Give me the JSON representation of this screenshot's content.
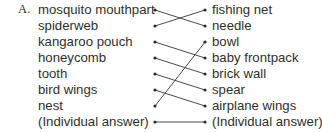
{
  "exercise": {
    "label": "A."
  },
  "matching": {
    "left_items": [
      {
        "id": "l1",
        "label": "mosquito mouthpart",
        "row": 1
      },
      {
        "id": "l2",
        "label": "spiderweb",
        "row": 2
      },
      {
        "id": "l3",
        "label": "kangaroo pouch",
        "row": 3
      },
      {
        "id": "l4",
        "label": "honeycomb",
        "row": 4
      },
      {
        "id": "l5",
        "label": "tooth",
        "row": 5
      },
      {
        "id": "l6",
        "label": "bird wings",
        "row": 6
      },
      {
        "id": "l7",
        "label": "nest",
        "row": 7
      },
      {
        "id": "l8",
        "label": "(Individual answer)",
        "row": 8
      }
    ],
    "right_items": [
      {
        "id": "r1",
        "label": "fishing net",
        "row": 1
      },
      {
        "id": "r2",
        "label": "needle",
        "row": 2
      },
      {
        "id": "r3",
        "label": "bowl",
        "row": 3
      },
      {
        "id": "r4",
        "label": "baby frontpack",
        "row": 4
      },
      {
        "id": "r5",
        "label": "brick wall",
        "row": 5
      },
      {
        "id": "r6",
        "label": "spear",
        "row": 6
      },
      {
        "id": "r7",
        "label": "airplane wings",
        "row": 7
      },
      {
        "id": "r8",
        "label": "(Individual answer)",
        "row": 8
      }
    ],
    "connections": [
      {
        "from_row": 1,
        "to_row": 2,
        "from_label": "mosquito mouthpart",
        "to_label": "needle"
      },
      {
        "from_row": 2,
        "to_row": 1,
        "from_label": "spiderweb",
        "to_label": "fishing net"
      },
      {
        "from_row": 3,
        "to_row": 4,
        "from_label": "kangaroo pouch",
        "to_label": "baby frontpack"
      },
      {
        "from_row": 4,
        "to_row": 5,
        "from_label": "honeycomb",
        "to_label": "brick wall"
      },
      {
        "from_row": 5,
        "to_row": 6,
        "from_label": "tooth",
        "to_label": "spear"
      },
      {
        "from_row": 6,
        "to_row": 7,
        "from_label": "bird wings",
        "to_label": "airplane wings"
      },
      {
        "from_row": 7,
        "to_row": 3,
        "from_label": "nest",
        "to_label": "bowl"
      },
      {
        "from_row": 8,
        "to_row": 8,
        "from_label": "(Individual answer)",
        "to_label": "(Individual answer)"
      }
    ],
    "geometry": {
      "row_top_y": 10,
      "row_spacing": 16,
      "left_node_x": 155,
      "right_node_x": 205,
      "dot_radius": 1.6
    },
    "colors": {
      "text": "#2f2f2f",
      "line": "#4a4a4a",
      "dot": "#2b2b2b",
      "background": "#ffffff"
    }
  }
}
